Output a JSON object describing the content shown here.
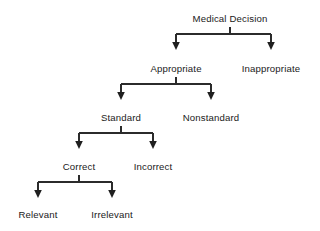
{
  "diagram": {
    "title_text": "Medical Decision",
    "type": "tree-hierarchy",
    "background_color": "#ffffff",
    "line_color": "#2b2b2b",
    "text_color": "#1a1a1a",
    "nodes": [
      {
        "id": "medical-decision",
        "label": "Medical Decision",
        "x": 230,
        "y": 22,
        "level": 0
      },
      {
        "id": "appropriate",
        "label": "Appropriate",
        "x": 176,
        "y": 72,
        "level": 1
      },
      {
        "id": "inappropriate",
        "label": "Inappropriate",
        "x": 271,
        "y": 72,
        "level": 1
      },
      {
        "id": "standard",
        "label": "Standard",
        "x": 121,
        "y": 121,
        "level": 2
      },
      {
        "id": "nonstandard",
        "label": "Nonstandard",
        "x": 211,
        "y": 121,
        "level": 2
      },
      {
        "id": "correct",
        "label": "Correct",
        "x": 79,
        "y": 170,
        "level": 3
      },
      {
        "id": "incorrect",
        "label": "Incorrect",
        "x": 153,
        "y": 170,
        "level": 3
      },
      {
        "id": "relevant",
        "label": "Relevant",
        "x": 38,
        "y": 218,
        "level": 4
      },
      {
        "id": "irrelevant",
        "label": "Irrelevant",
        "x": 112,
        "y": 218,
        "level": 4
      }
    ],
    "edges": [
      {
        "from": "medical-decision",
        "to": "appropriate"
      },
      {
        "from": "medical-decision",
        "to": "inappropriate"
      },
      {
        "from": "appropriate",
        "to": "standard"
      },
      {
        "from": "appropriate",
        "to": "nonstandard"
      },
      {
        "from": "standard",
        "to": "correct"
      },
      {
        "from": "standard",
        "to": "incorrect"
      },
      {
        "from": "correct",
        "to": "relevant"
      },
      {
        "from": "correct",
        "to": "irrelevant"
      }
    ],
    "branch_groups": [
      {
        "id": "branch-medical-decision",
        "parent_x": 230,
        "stem_top": 27,
        "bar_y": 34,
        "child_left_x": 176,
        "child_right_x": 271,
        "arrow_tip_y": 50
      },
      {
        "id": "branch-appropriate",
        "parent_x": 176,
        "stem_top": 77,
        "bar_y": 84,
        "child_left_x": 121,
        "child_right_x": 211,
        "arrow_tip_y": 100
      },
      {
        "id": "branch-standard",
        "parent_x": 121,
        "stem_top": 126,
        "bar_y": 133,
        "child_left_x": 79,
        "child_right_x": 153,
        "arrow_tip_y": 149
      },
      {
        "id": "branch-correct",
        "parent_x": 79,
        "stem_top": 175,
        "bar_y": 182,
        "child_left_x": 38,
        "child_right_x": 112,
        "arrow_tip_y": 198
      }
    ]
  }
}
